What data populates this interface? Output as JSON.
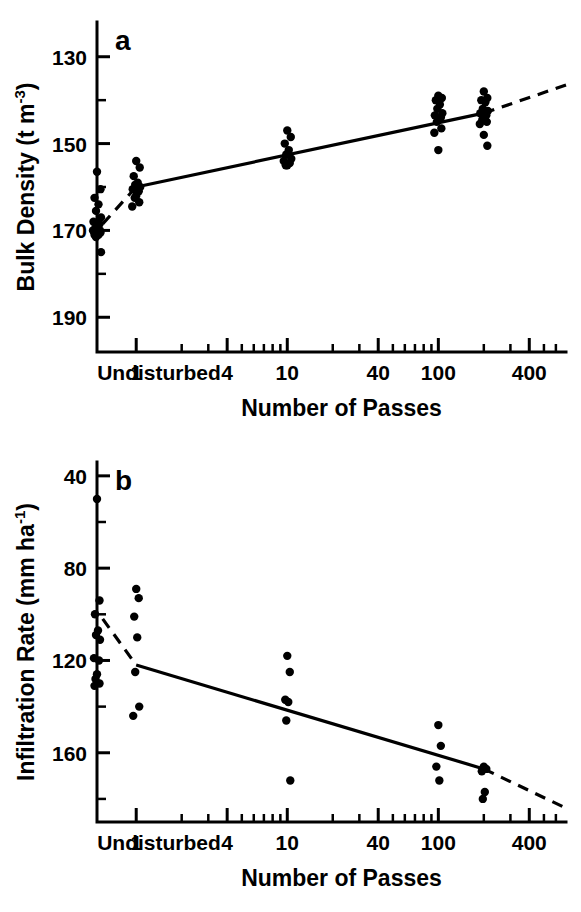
{
  "figure": {
    "panels": [
      "a",
      "b"
    ],
    "xaxis_title": "Number of Passes",
    "xtick_labels": [
      "Undisturbed",
      "1",
      "4",
      "10",
      "40",
      "100",
      "400"
    ],
    "background_color": "#ffffff",
    "ink_color": "#000000"
  },
  "panel_a": {
    "label": "a",
    "ylabel_main": "Bulk Density  (t m",
    "ylabel_exp": "-3",
    "ylabel_close": ")",
    "ytick_labels": [
      "190",
      "170",
      "150",
      "130"
    ]
  },
  "panel_b": {
    "label": "b",
    "ylabel_main": "Infiltration Rate (mm ha",
    "ylabel_exp": "-1",
    "ylabel_close": ")",
    "ytick_labels": [
      "160",
      "120",
      "80",
      "40"
    ]
  },
  "chart_data": [
    {
      "type": "scatter",
      "panel": "a",
      "title": "a",
      "xlabel": "Number of Passes",
      "ylabel": "Bulk Density (t m-3)",
      "xscale": "log",
      "xlim": [
        0.55,
        700
      ],
      "ylim": [
        122,
        198
      ],
      "ytick_major": [
        130,
        150,
        170,
        190
      ],
      "ytick_minor": [
        140,
        160,
        180
      ],
      "xtick_major": [
        1,
        4,
        10,
        40,
        100,
        400
      ],
      "xtick_minor": [
        2,
        3,
        5,
        6,
        7,
        8,
        9,
        20,
        30,
        50,
        60,
        70,
        80,
        90,
        200,
        300,
        500,
        600
      ],
      "grid": false,
      "legend": "none",
      "undisturbed_x_category": "Undisturbed",
      "series": [
        {
          "name": "Undisturbed",
          "x_category": "Undisturbed",
          "values": [
            163.5,
            159.5,
            157.5,
            156.0,
            154.5,
            153.0,
            152.0,
            151.5,
            151.0,
            150.5,
            150.0,
            150.0,
            149.5,
            149.5,
            149.0,
            149.0,
            148.5,
            145.0
          ]
        },
        {
          "name": "1 pass",
          "x": 1,
          "values": [
            166.0,
            164.5,
            162.5,
            161.0,
            160.5,
            160.0,
            159.5,
            159.0,
            158.0,
            157.5,
            156.5,
            155.5
          ]
        },
        {
          "name": "10 passes",
          "x": 10,
          "values": [
            173.0,
            171.5,
            170.0,
            168.5,
            167.5,
            166.5,
            166.0,
            165.5,
            165.0,
            165.0
          ]
        },
        {
          "name": "100 passes",
          "x": 100,
          "values": [
            181.0,
            180.5,
            180.0,
            179.0,
            178.0,
            177.0,
            176.5,
            176.0,
            175.5,
            175.0,
            173.5,
            172.5,
            168.5
          ]
        },
        {
          "name": "200 passes",
          "x": 200,
          "values": [
            182.0,
            180.5,
            180.0,
            179.5,
            178.0,
            177.5,
            177.0,
            176.5,
            176.0,
            175.5,
            175.0,
            174.5,
            172.0,
            169.5
          ]
        }
      ],
      "fit_line": {
        "style": "solid-with-dashed-extensions",
        "solid_x_range": [
          1,
          200
        ],
        "solid_y_range": [
          160.0,
          177.0
        ],
        "dashed_left_x_range": [
          0.6,
          1
        ],
        "dashed_left_y_range": [
          151.5,
          160.0
        ],
        "dashed_right_x_range": [
          200,
          700
        ],
        "dashed_right_y_range": [
          177.0,
          183.5
        ]
      }
    },
    {
      "type": "scatter",
      "panel": "b",
      "title": "b",
      "xlabel": "Number of Passes",
      "ylabel": "Infiltration Rate (mm ha-1)",
      "xscale": "log",
      "xlim": [
        0.55,
        700
      ],
      "ylim": [
        10,
        166
      ],
      "ytick_major": [
        40,
        80,
        120,
        160
      ],
      "ytick_minor": [
        20,
        60,
        100,
        140
      ],
      "xtick_major": [
        1,
        4,
        10,
        40,
        100,
        400
      ],
      "xtick_minor": [
        2,
        3,
        5,
        6,
        7,
        8,
        9,
        20,
        30,
        50,
        60,
        70,
        80,
        90,
        200,
        300,
        500,
        600
      ],
      "grid": false,
      "legend": "none",
      "undisturbed_x_category": "Undisturbed",
      "series": [
        {
          "name": "Undisturbed",
          "x_category": "Undisturbed",
          "values": [
            150.0,
            106.0,
            100.0,
            93.0,
            91.0,
            89.0,
            81.0,
            80.0,
            74.0,
            72.0,
            70.0,
            69.0
          ]
        },
        {
          "name": "1 pass",
          "x": 1,
          "values": [
            111.0,
            107.0,
            99.0,
            90.0,
            75.0,
            60.0,
            56.0
          ]
        },
        {
          "name": "10 passes",
          "x": 10,
          "values": [
            82.0,
            75.0,
            63.0,
            62.0,
            54.0,
            28.0
          ]
        },
        {
          "name": "100 passes",
          "x": 100,
          "values": [
            52.0,
            43.0,
            34.0,
            28.0
          ]
        },
        {
          "name": "200 passes",
          "x": 200,
          "values": [
            34.0,
            33.0,
            32.0,
            23.0,
            20.0
          ]
        }
      ],
      "fit_line": {
        "style": "solid-with-dashed-extensions",
        "solid_x_range": [
          1,
          200
        ],
        "solid_y_range": [
          78.0,
          33.0
        ],
        "dashed_left_x_range": [
          0.6,
          1
        ],
        "dashed_left_y_range": [
          98.0,
          78.0
        ],
        "dashed_right_x_range": [
          200,
          700
        ],
        "dashed_right_y_range": [
          33.0,
          16.0
        ]
      }
    }
  ]
}
